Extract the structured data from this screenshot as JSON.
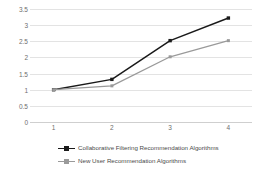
{
  "chart_data": {
    "type": "line",
    "title": "",
    "xlabel": "",
    "ylabel": "",
    "categories": [
      "1",
      "2",
      "3",
      "4"
    ],
    "x": [
      1,
      2,
      3,
      4
    ],
    "ylim": [
      0,
      3.5
    ],
    "yticks": [
      "0",
      "0.5",
      "1",
      "1.5",
      "2",
      "2.5",
      "3",
      "3.5"
    ],
    "ytick_values": [
      0,
      0.5,
      1,
      1.5,
      2,
      2.5,
      3,
      3.5
    ],
    "grid": true,
    "legend_position": "bottom-left",
    "series": [
      {
        "name": "Collaborative Filtering Recommendation Algorithms",
        "values": [
          1.0,
          1.32,
          2.52,
          3.22
        ],
        "color": "#1a1a1a",
        "marker": "square"
      },
      {
        "name": "New User Recommendation Algorithms",
        "values": [
          1.0,
          1.12,
          2.02,
          2.52
        ],
        "color": "#9a9a9a",
        "marker": "square"
      }
    ]
  },
  "style": {
    "background": "#ffffff",
    "gridline_color": "#e3e3e3",
    "axis_color": "#cfcfcf",
    "tick_label_color": "#6e6e6e",
    "legend_label_color": "#4a4a4a"
  }
}
